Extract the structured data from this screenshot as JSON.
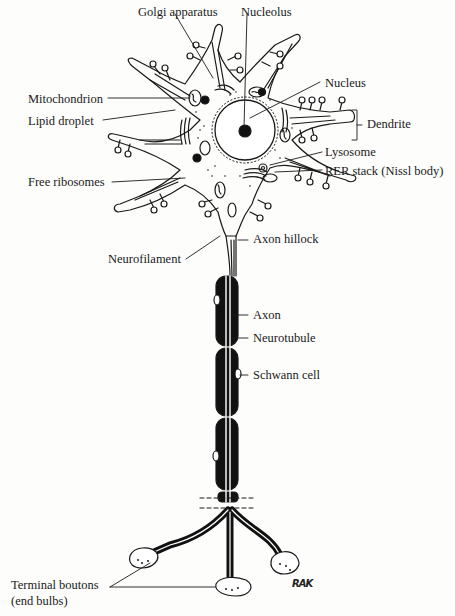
{
  "diagram": {
    "colors": {
      "ink": "#1a1a1a",
      "background": "#fdfdfc"
    },
    "labels": {
      "golgi": "Golgi apparatus",
      "nucleolus": "Nucleolus",
      "nucleus": "Nucleus",
      "mitochondrion": "Mitochondrion",
      "lipid": "Lipid droplet",
      "dendrite": "Dendrite",
      "lysosome": "Lysosome",
      "rer": "RER stack (Nissl body)",
      "ribosomes": "Free ribosomes",
      "hillock": "Axon hillock",
      "neurofilament": "Neurofilament",
      "axon": "Axon",
      "neurotubule": "Neurotubule",
      "schwann": "Schwann cell",
      "boutons_line1": "Terminal boutons",
      "boutons_line2": "(end bulbs)"
    },
    "signature": "RAK"
  }
}
